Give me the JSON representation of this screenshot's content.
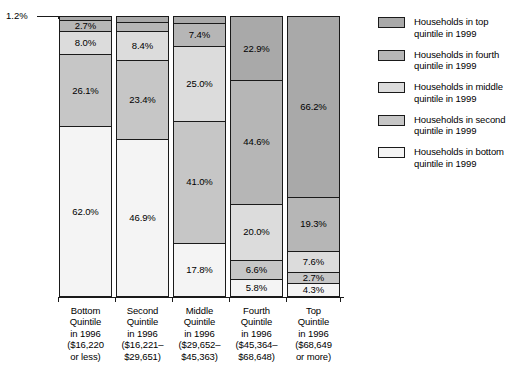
{
  "chart_data": {
    "type": "bar",
    "subtype": "100% stacked column",
    "title": "",
    "xlabel": "",
    "ylabel": "",
    "ylim": [
      0,
      100
    ],
    "grid": false,
    "legend_position": "right",
    "categories": [
      "Bottom Quintile in 1996 ($16,220 or less)",
      "Second Quintile in 1996 ($16,221–$29,651)",
      "Middle Quintile in 1996 ($29,652–$45,363)",
      "Fourth Quintile in 1996 ($45,364–$68,648)",
      "Top Quintile in 1996 ($68,649 or more)"
    ],
    "series": [
      {
        "name": "Households in top quintile in 1999",
        "values": [
          1.2,
          1.4,
          2.1,
          22.9,
          66.2
        ]
      },
      {
        "name": "Households in fourth quintile in 1999",
        "values": [
          2.7,
          2.4,
          7.4,
          44.6,
          19.3
        ]
      },
      {
        "name": "Households in middle quintile in 1999",
        "values": [
          8.0,
          8.4,
          25.0,
          20.0,
          7.6
        ]
      },
      {
        "name": "Households in second quintile in 1999",
        "values": [
          26.1,
          23.4,
          41.0,
          6.6,
          2.7
        ]
      },
      {
        "name": "Households in bottom quintile in 1999",
        "values": [
          62.0,
          46.9,
          17.8,
          5.8,
          4.3
        ]
      }
    ],
    "callout": {
      "label": "1.2%",
      "points_to": "bar1-top-segment"
    }
  },
  "bars": [
    {
      "id": "bar-bottom-quintile",
      "segments": [
        {
          "label": "1.2%",
          "value": 1.2,
          "fill": "top",
          "show_label": false
        },
        {
          "label": "2.7%",
          "value": 2.7,
          "fill": "fourth",
          "show_label": true
        },
        {
          "label": "8.0%",
          "value": 8.0,
          "fill": "middle",
          "show_label": true
        },
        {
          "label": "26.1%",
          "value": 26.1,
          "fill": "second",
          "show_label": true
        },
        {
          "label": "62.0%",
          "value": 62.0,
          "fill": "bottom",
          "show_label": true
        }
      ]
    },
    {
      "id": "bar-second-quintile",
      "segments": [
        {
          "label": "",
          "value": 1.4,
          "fill": "top",
          "show_label": false
        },
        {
          "label": "2.4%",
          "value": 2.4,
          "fill": "fourth",
          "show_label": true
        },
        {
          "label": "8.4%",
          "value": 8.4,
          "fill": "middle",
          "show_label": true
        },
        {
          "label": "23.4%",
          "value": 23.4,
          "fill": "second",
          "show_label": true
        },
        {
          "label": "46.9%",
          "value": 46.9,
          "fill": "bottom",
          "show_label": true
        },
        {
          "label": "18.9%",
          "value": 18.9,
          "fill": "bottom-light",
          "show_label": true
        }
      ]
    },
    {
      "id": "bar-middle-quintile",
      "segments": [
        {
          "label": "",
          "value": 2.1,
          "fill": "top",
          "show_label": false
        },
        {
          "label": "7.4%",
          "value": 7.4,
          "fill": "fourth",
          "show_label": true
        },
        {
          "label": "25.0%",
          "value": 25.0,
          "fill": "middle-dark",
          "show_label": true
        },
        {
          "label": "41.0%",
          "value": 41.0,
          "fill": "middle",
          "show_label": true
        },
        {
          "label": "17.8%",
          "value": 17.8,
          "fill": "second",
          "show_label": true
        },
        {
          "label": "8.9%",
          "value": 8.9,
          "fill": "bottom",
          "show_label": true
        }
      ]
    },
    {
      "id": "bar-fourth-quintile",
      "segments": [
        {
          "label": "22.9%",
          "value": 22.9,
          "fill": "top",
          "show_label": true
        },
        {
          "label": "44.6%",
          "value": 44.6,
          "fill": "fourth",
          "show_label": true
        },
        {
          "label": "20.0%",
          "value": 20.0,
          "fill": "middle",
          "show_label": true
        },
        {
          "label": "6.6%",
          "value": 6.6,
          "fill": "second",
          "show_label": true
        },
        {
          "label": "5.8%",
          "value": 5.8,
          "fill": "bottom",
          "show_label": true
        }
      ]
    },
    {
      "id": "bar-top-quintile",
      "segments": [
        {
          "label": "66.2%",
          "value": 66.2,
          "fill": "top",
          "show_label": true
        },
        {
          "label": "19.3%",
          "value": 19.3,
          "fill": "fourth",
          "show_label": true
        },
        {
          "label": "7.6%",
          "value": 7.6,
          "fill": "middle",
          "show_label": true
        },
        {
          "label": "2.7%",
          "value": 2.7,
          "fill": "second",
          "show_label": true
        },
        {
          "label": "4.3%",
          "value": 4.3,
          "fill": "bottom",
          "show_label": true
        }
      ]
    }
  ],
  "callout": {
    "label": "1.2%"
  },
  "category_labels": [
    {
      "lines": [
        "Bottom",
        "Quintile",
        "in 1996",
        "($16,220",
        "or less)"
      ]
    },
    {
      "lines": [
        "Second",
        "Quintile",
        "in 1996",
        "($16,221–",
        "$29,651)"
      ]
    },
    {
      "lines": [
        "Middle",
        "Quintile",
        "in 1996",
        "($29,652–",
        "$45,363)"
      ]
    },
    {
      "lines": [
        "Fourth",
        "Quintile",
        "in 1996",
        "($45,364–",
        "$68,648)"
      ]
    },
    {
      "lines": [
        "Top",
        "Quintile",
        "in 1996",
        "($68,649",
        "or more)"
      ]
    }
  ],
  "legend": {
    "items": [
      {
        "lines": [
          "Households in top",
          "quintile in 1999"
        ],
        "color": "#a9a9a9",
        "swatch": "fill-top"
      },
      {
        "lines": [
          "Households in fourth",
          "quintile in 1999"
        ],
        "color": "#b6b6b6",
        "swatch": "fill-fourth"
      },
      {
        "lines": [
          "Households in middle",
          "quintile in 1999"
        ],
        "color": "#dcdcdc",
        "swatch": "fill-middle"
      },
      {
        "lines": [
          "Households in second",
          "quintile in 1999"
        ],
        "color": "#c6c6c6",
        "swatch": "fill-second"
      },
      {
        "lines": [
          "Households in bottom",
          "quintile in 1999"
        ],
        "color": "#f4f4f4",
        "swatch": "fill-bottom"
      }
    ]
  },
  "colors": {
    "top": "#a9a9a9",
    "fourth": "#b6b6b6",
    "middle": "#dcdcdc",
    "second": "#c6c6c6",
    "bottom": "#f4f4f4",
    "outline": "#1a1a1a",
    "background": "#ffffff"
  }
}
